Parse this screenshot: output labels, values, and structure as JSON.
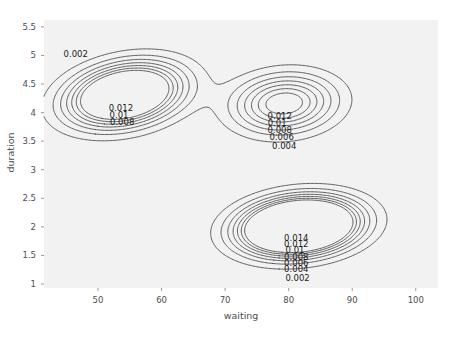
{
  "chart_data": {
    "type": "contour",
    "title": "",
    "subtitle": "",
    "xlabel": "waiting",
    "ylabel": "duration",
    "xlim": [
      41.5,
      103.5
    ],
    "ylim": [
      0.93,
      5.62
    ],
    "xticks": [
      "50",
      "60",
      "70",
      "80",
      "90",
      "100"
    ],
    "xtick_values": [
      50,
      60,
      70,
      80,
      90,
      100
    ],
    "yticks": [
      "5.5",
      "5",
      "4.5",
      "4",
      "3.5",
      "3",
      "2.5",
      "2",
      "1.5",
      "1"
    ],
    "ytick_values": [
      5.5,
      5,
      4.5,
      4,
      3.5,
      3,
      2.5,
      2,
      1.5,
      1
    ],
    "grid": false,
    "legend": "none",
    "levels": [
      0.002,
      0.004,
      0.006,
      0.008,
      0.01,
      0.012,
      0.014
    ],
    "line_color": "#4d4d4d",
    "panel_color": "#f2f2f2",
    "modes": [
      {
        "name": "left-mode",
        "x": 54.0,
        "y": 4.32,
        "peak_level": 0.012
      },
      {
        "name": "middle-mode",
        "x": 79.0,
        "y": 4.15,
        "peak_level": 0.012
      },
      {
        "name": "lower-right-mode",
        "x": 81.5,
        "y": 2.0,
        "peak_level": 0.014
      }
    ],
    "contour_labels": [
      {
        "id": "outer-left",
        "text": "0.002",
        "x_data": 46.5,
        "y_data": 5.0
      },
      {
        "id": "left-012",
        "text": "0.012",
        "x_data": 53.6,
        "y_data": 4.07
      },
      {
        "id": "left-010",
        "text": "0.01",
        "x_data": 53.3,
        "y_data": 3.94
      },
      {
        "id": "left-008",
        "text": "0.008",
        "x_data": 53.8,
        "y_data": 3.82
      },
      {
        "id": "mid-012",
        "text": "0.012",
        "x_data": 78.6,
        "y_data": 3.93
      },
      {
        "id": "mid-010",
        "text": "0.01",
        "x_data": 78.2,
        "y_data": 3.8
      },
      {
        "id": "mid-008",
        "text": "0.008",
        "x_data": 78.6,
        "y_data": 3.68
      },
      {
        "id": "mid-006",
        "text": "0.006",
        "x_data": 78.9,
        "y_data": 3.55
      },
      {
        "id": "mid-004",
        "text": "0.004",
        "x_data": 79.3,
        "y_data": 3.4
      },
      {
        "id": "low-014",
        "text": "0.014",
        "x_data": 81.2,
        "y_data": 1.79
      },
      {
        "id": "low-012",
        "text": "0.012",
        "x_data": 81.2,
        "y_data": 1.68
      },
      {
        "id": "low-010",
        "text": "0.01",
        "x_data": 81.0,
        "y_data": 1.57
      },
      {
        "id": "low-008",
        "text": "0.008",
        "x_data": 81.2,
        "y_data": 1.46
      },
      {
        "id": "low-006",
        "text": "0.006",
        "x_data": 81.2,
        "y_data": 1.35
      },
      {
        "id": "low-004",
        "text": "0.004",
        "x_data": 81.2,
        "y_data": 1.24
      },
      {
        "id": "low-002",
        "text": "0.002",
        "x_data": 81.4,
        "y_data": 1.09
      }
    ]
  }
}
